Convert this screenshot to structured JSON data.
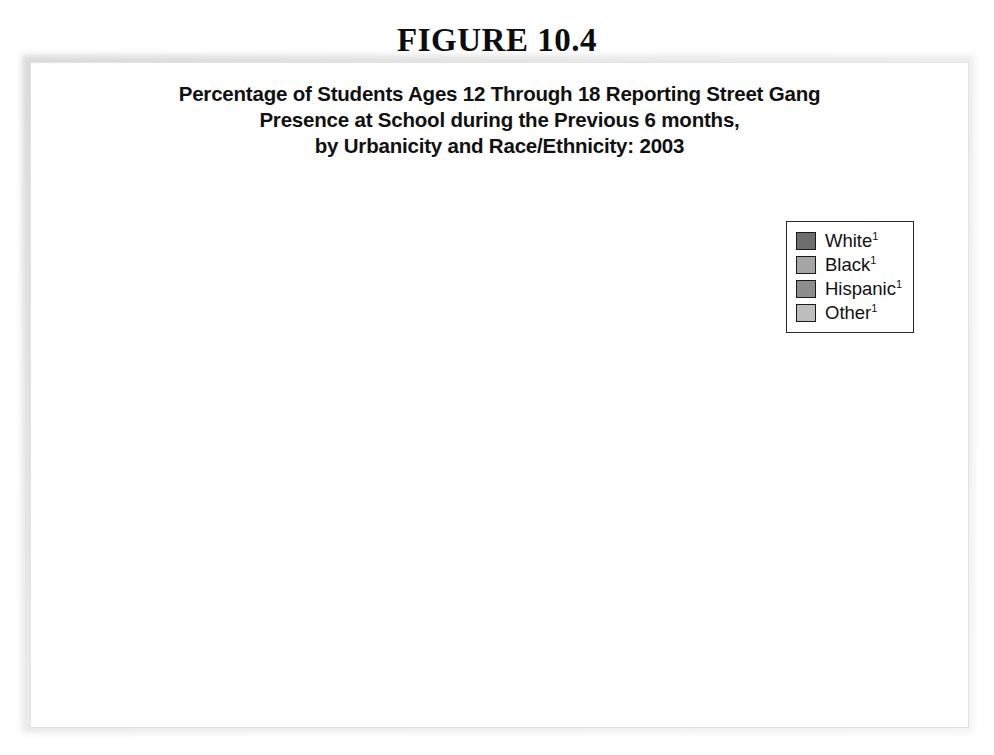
{
  "figure": {
    "heading": "FIGURE 10.4",
    "title_line_1": "Percentage of Students Ages 12 Through 18 Reporting Street Gang",
    "title_line_2": "Presence at School during the Previous 6 months,",
    "title_line_3": "by Urbanicity and Race/Ethnicity: 2003"
  },
  "chart_data": {
    "type": "bar",
    "title": "Percentage of Students Ages 12 Through 18 Reporting Street Gang Presence at School during the Previous 6 months, by Urbanicity and Race/Ethnicity: 2003",
    "xlabel": "Urbanicity",
    "ylabel": "Percent",
    "ylim": [
      0,
      50
    ],
    "yticks": [
      0,
      10,
      20,
      30,
      40,
      50
    ],
    "ytick_labels": [
      "0",
      "10",
      "20",
      "30",
      "40",
      "50"
    ],
    "grid": true,
    "legend_position": "top-right",
    "categories": [
      "Total",
      "Urban",
      "Suburban",
      "Rural"
    ],
    "series": [
      {
        "name": "White¹",
        "values": [
          11,
          20,
          14,
          11
        ],
        "color": "#6e6e6e"
      },
      {
        "name": "Black¹",
        "values": [
          29,
          33,
          28,
          22
        ],
        "color": "#a5a5a5"
      },
      {
        "name": "Hispanic¹",
        "values": [
          37,
          43,
          35,
          13
        ],
        "color": "#8c8c8c"
      },
      {
        "name": "Other¹",
        "values": [
          22,
          31,
          18,
          11
        ],
        "color": "#bdbdbd"
      }
    ],
    "value_labels": [
      [
        "11",
        "29",
        "37",
        "22"
      ],
      [
        "20",
        "33",
        "43",
        "31"
      ],
      [
        "14",
        "28",
        "35",
        "18"
      ],
      [
        "11",
        "22",
        "13",
        "11"
      ]
    ]
  },
  "legend": {
    "items": [
      {
        "label": "White",
        "note": "1"
      },
      {
        "label": "Black",
        "note": "1"
      },
      {
        "label": "Hispanic",
        "note": "1"
      },
      {
        "label": "Other",
        "note": "1"
      }
    ]
  }
}
